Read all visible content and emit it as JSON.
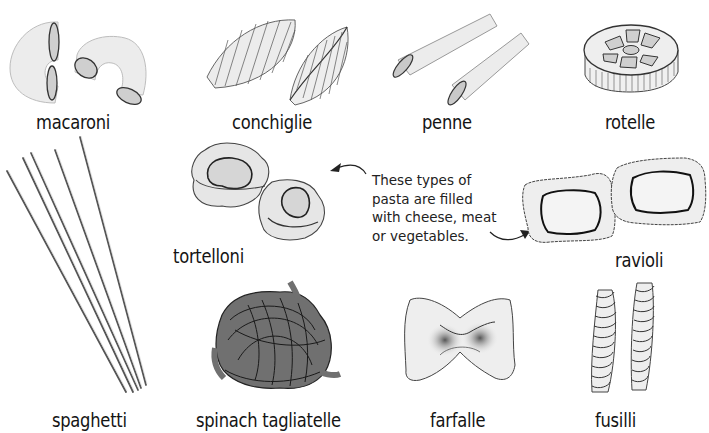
{
  "diagram": {
    "topic": "Types of pasta",
    "pasta": [
      {
        "id": "macaroni",
        "label": "macaroni"
      },
      {
        "id": "conchiglie",
        "label": "conchiglie"
      },
      {
        "id": "penne",
        "label": "penne"
      },
      {
        "id": "rotelle",
        "label": "rotelle"
      },
      {
        "id": "spaghetti",
        "label": "spaghetti"
      },
      {
        "id": "tortelloni",
        "label": "tortelloni"
      },
      {
        "id": "ravioli",
        "label": "ravioli"
      },
      {
        "id": "spinach-tagliatelle",
        "label": "spinach tagliatelle"
      },
      {
        "id": "farfalle",
        "label": "farfalle"
      },
      {
        "id": "fusilli",
        "label": "fusilli"
      }
    ],
    "caption": {
      "lines": [
        "These types of",
        "pasta are filled",
        "with cheese, meat",
        "or vegetables."
      ],
      "points_to": [
        "tortelloni",
        "ravioli"
      ]
    },
    "colors": {
      "background": "#ffffff",
      "outline": "#2a2a2a",
      "pasta_fill": "#e9e9e9",
      "pasta_shade": "#c9c9c9",
      "spinach_fill": "#707070",
      "text": "#141414"
    }
  }
}
